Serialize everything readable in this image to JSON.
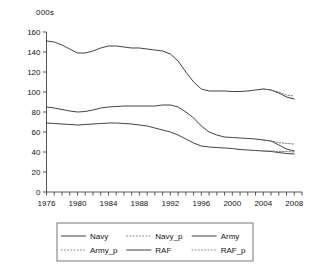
{
  "chart_data": {
    "type": "line",
    "title": "",
    "subtitle": "",
    "unit_label": "000s",
    "xlabel": "",
    "ylabel": "",
    "xlim": [
      1976,
      2009
    ],
    "ylim": [
      0,
      160
    ],
    "ytick_step": 20,
    "grid": false,
    "legend_position": "bottom",
    "yticks": [
      "0",
      "20",
      "40",
      "60",
      "80",
      "100",
      "120",
      "140",
      "160"
    ],
    "xticks": [
      "1976",
      "1980",
      "1984",
      "1988",
      "1992",
      "1996",
      "2000",
      "2004",
      "2008"
    ],
    "xtick_all_years": [
      1976,
      1977,
      1978,
      1979,
      1980,
      1981,
      1982,
      1983,
      1984,
      1985,
      1986,
      1987,
      1988,
      1989,
      1990,
      1991,
      1992,
      1993,
      1994,
      1995,
      1996,
      1997,
      1998,
      1999,
      2000,
      2001,
      2002,
      2003,
      2004,
      2005,
      2006,
      2007,
      2008,
      2009
    ],
    "series": [
      {
        "name": "Navy",
        "style": "solid",
        "color": "#2b2b2b",
        "x": [
          1976,
          1977,
          1978,
          1979,
          1980,
          1981,
          1982,
          1983,
          1984,
          1985,
          1986,
          1987,
          1988,
          1989,
          1990,
          1991,
          1992,
          1993,
          1994,
          1995,
          1996,
          1997,
          1998,
          1999,
          2000,
          2001,
          2002,
          2003,
          2004,
          2005,
          2006,
          2007,
          2008
        ],
        "values": [
          69,
          68.5,
          68,
          67.5,
          67,
          67.5,
          68,
          68.5,
          69,
          69,
          68.5,
          68,
          67,
          66,
          64,
          62,
          60,
          57,
          53,
          49,
          46,
          45,
          44.5,
          44,
          43.5,
          42.5,
          42,
          41.5,
          41,
          40.5,
          39.5,
          38.5,
          38
        ]
      },
      {
        "name": "Navy_p",
        "style": "dotted",
        "color": "#6f6f6f",
        "x": [
          2004,
          2005,
          2006,
          2007,
          2008
        ],
        "values": [
          41,
          41,
          40.5,
          40.5,
          40
        ]
      },
      {
        "name": "Army",
        "style": "solid",
        "color": "#2b2b2b",
        "x": [
          1976,
          1977,
          1978,
          1979,
          1980,
          1981,
          1982,
          1983,
          1984,
          1985,
          1986,
          1987,
          1988,
          1989,
          1990,
          1991,
          1992,
          1993,
          1994,
          1995,
          1996,
          1997,
          1998,
          1999,
          2000,
          2001,
          2002,
          2003,
          2004,
          2005,
          2006,
          2007,
          2008
        ],
        "values": [
          151,
          150,
          147,
          143,
          139,
          139,
          141,
          144,
          146,
          146,
          145,
          144,
          144,
          143,
          142,
          141,
          138,
          131,
          120,
          110,
          103,
          101,
          101,
          101,
          100.5,
          100.5,
          101,
          102,
          103,
          102,
          99,
          95,
          93
        ]
      },
      {
        "name": "Army_p",
        "style": "dotted",
        "color": "#6f6f6f",
        "x": [
          2004,
          2005,
          2006,
          2007,
          2008
        ],
        "values": [
          103,
          102,
          100,
          97,
          96
        ]
      },
      {
        "name": "RAF",
        "style": "solid",
        "color": "#2b2b2b",
        "x": [
          1976,
          1977,
          1978,
          1979,
          1980,
          1981,
          1982,
          1983,
          1984,
          1985,
          1986,
          1987,
          1988,
          1989,
          1990,
          1991,
          1992,
          1993,
          1994,
          1995,
          1996,
          1997,
          1998,
          1999,
          2000,
          2001,
          2002,
          2003,
          2004,
          2005,
          2006,
          2007,
          2008
        ],
        "values": [
          85,
          84,
          82.5,
          81,
          80,
          80.5,
          82,
          84,
          85,
          85.5,
          86,
          86,
          86,
          86,
          86,
          87,
          87,
          85,
          80,
          74,
          66,
          60,
          57,
          55,
          54.5,
          54,
          53.5,
          53,
          52,
          51,
          47,
          43,
          41
        ]
      },
      {
        "name": "RAF_p",
        "style": "dotted",
        "color": "#6f6f6f",
        "x": [
          2004,
          2005,
          2006,
          2007,
          2008
        ],
        "values": [
          52,
          51,
          49.5,
          48.5,
          48
        ]
      }
    ]
  },
  "legend": {
    "entries": [
      {
        "label": "Navy",
        "style": "solid"
      },
      {
        "label": "Navy_p",
        "style": "dotted"
      },
      {
        "label": "Army",
        "style": "solid"
      },
      {
        "label": "Army_p",
        "style": "dotted"
      },
      {
        "label": "RAF",
        "style": "solid"
      },
      {
        "label": "RAF_p",
        "style": "dotted"
      }
    ]
  }
}
